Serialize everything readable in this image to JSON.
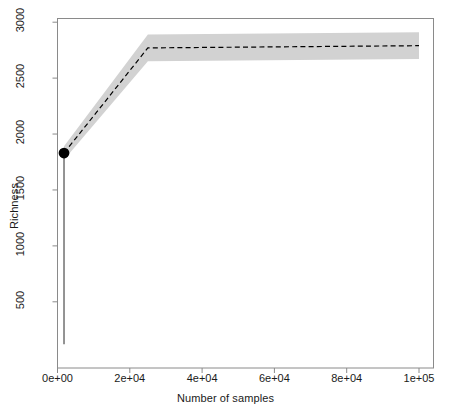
{
  "chart_data": {
    "type": "line",
    "title": "",
    "subtitle": "",
    "xlabel": "Number of samples",
    "ylabel": "Richness",
    "xlim": [
      0,
      108000
    ],
    "ylim": [
      0,
      3100
    ],
    "grid": false,
    "legend": "none",
    "x_ticks": [
      {
        "value": 0,
        "label": "0e+00"
      },
      {
        "value": 20000,
        "label": "2e+04"
      },
      {
        "value": 40000,
        "label": "4e+04"
      },
      {
        "value": 60000,
        "label": "6e+04"
      },
      {
        "value": 80000,
        "label": "8e+04"
      },
      {
        "value": 100000,
        "label": "1e+05"
      }
    ],
    "y_ticks": [
      {
        "value": 500,
        "label": "500"
      },
      {
        "value": 1000,
        "label": "1000"
      },
      {
        "value": 1500,
        "label": "1500"
      },
      {
        "value": 2000,
        "label": "2000"
      },
      {
        "value": 2500,
        "label": "2500"
      },
      {
        "value": 3000,
        "label": "3000"
      }
    ],
    "series": [
      {
        "name": "Rarefaction / extrapolation estimate",
        "style": "dashed",
        "color": "#000000",
        "x": [
          1800,
          25000,
          100000
        ],
        "values": [
          1830,
          2770,
          2790
        ]
      }
    ],
    "confidence_band": {
      "name": "95% confidence interval",
      "color": "#d2d2d2",
      "x": [
        1800,
        25000,
        100000
      ],
      "lower": [
        1770,
        2650,
        2670
      ],
      "upper": [
        1890,
        2890,
        2910
      ]
    },
    "observed_point": {
      "name": "Observed sample richness",
      "x": 1800,
      "y": 1830,
      "color": "#000000",
      "marker": "filled-circle"
    },
    "reference_line": {
      "name": "Observed sample vertical reference",
      "x": 1800,
      "y_top": 1830,
      "y_bottom": 120,
      "color": "#4d4d4d",
      "style": "solid"
    }
  }
}
